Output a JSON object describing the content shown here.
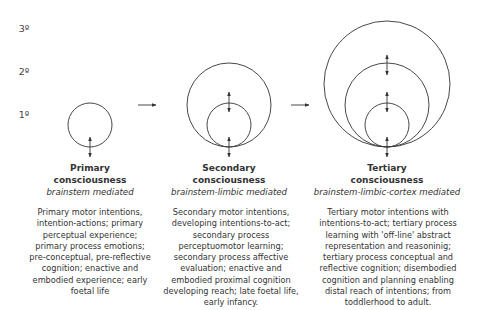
{
  "levels": [
    {
      "label": "3º",
      "y": 29
    },
    {
      "label": "2º",
      "y": 72
    },
    {
      "label": "1º",
      "y": 115
    }
  ],
  "stages": [
    {
      "title_line1": "Primary",
      "title_line2": "consciousness",
      "mediation": "brainstem mediated",
      "description": "Primary motor intentions, intention-actions; primary perceptual experience; primary process emotions; pre-conceptual, pre-reflective cognition; enactive and embodied experience; early foetal life"
    },
    {
      "title_line1": "Secondary",
      "title_line2": "consciousness",
      "mediation": "brainstem-limbic mediated",
      "description": "Secondary motor intentions, developing intentions-to-act; secondary process perceptuomotor learning; secondary process affective evaluation; enactive and embodied proximal cognition developing reach; late foetal life, early infancy."
    },
    {
      "title_line1": "Tertiary",
      "title_line2": "consciousness",
      "mediation": "brainstem-limbic-cortex mediated",
      "description": "Tertiary motor intentions with intentions-to-act; tertiary process learning with 'off-line' abstract representation and reasoninig; tertiary process conceptual and reflective cognition; disembodied cognition and planning enabling distal reach of intentions; from toddlerhood to adult."
    }
  ],
  "colors": {
    "line": "#333333",
    "text": "#333333",
    "background": "#ffffff"
  }
}
